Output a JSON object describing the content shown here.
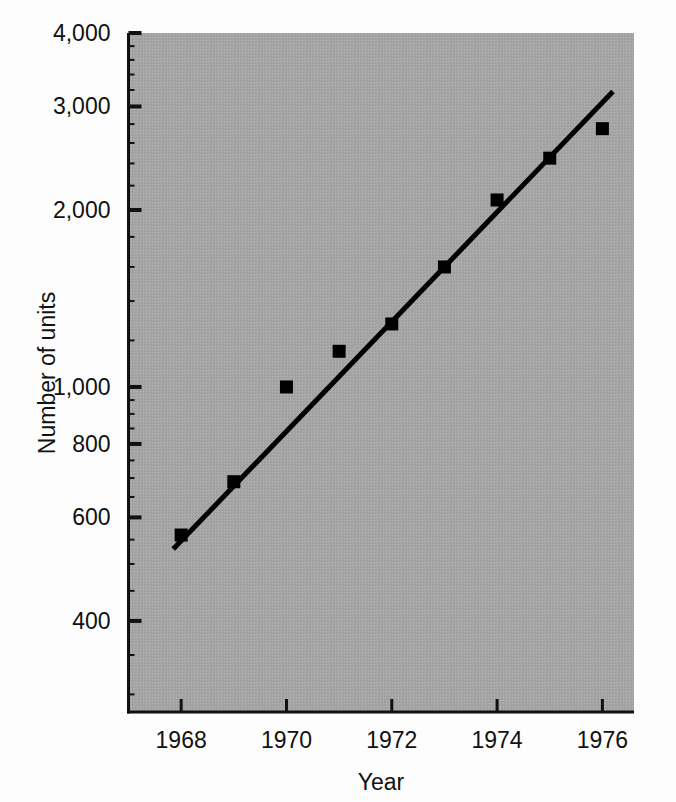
{
  "figure": {
    "background_color": "#fdfdfd",
    "plot_fill_color": "#a8a8a8",
    "axis_color": "#111111",
    "marker_color": "#000000",
    "line_color": "#000000"
  },
  "axes": {
    "x_title": "Year",
    "y_title": "Number of units"
  },
  "ticks": {
    "y_major": [
      {
        "value": 400,
        "label": "400"
      },
      {
        "value": 600,
        "label": "600"
      },
      {
        "value": 800,
        "label": "800"
      },
      {
        "value": 1000,
        "label": "1,000"
      },
      {
        "value": 2000,
        "label": "2,000"
      },
      {
        "value": 3000,
        "label": "3,000"
      },
      {
        "value": 4000,
        "label": "4,000"
      }
    ],
    "y_minor": [
      300,
      350,
      450,
      500,
      550,
      650,
      700,
      750,
      850,
      900,
      950,
      1200,
      1400,
      1600,
      1800,
      2200,
      2400,
      2600,
      2800,
      3200,
      3400,
      3600,
      3800
    ],
    "x_major": [
      {
        "value": 1968,
        "label": "1968"
      },
      {
        "value": 1970,
        "label": "1970"
      },
      {
        "value": 1972,
        "label": "1972"
      },
      {
        "value": 1974,
        "label": "1974"
      },
      {
        "value": 1976,
        "label": "1976"
      }
    ]
  },
  "chart_data": {
    "type": "scatter",
    "title": "",
    "xlabel": "Year",
    "ylabel": "Number of units",
    "xlim": [
      1967.0,
      1976.6
    ],
    "ylim": [
      280,
      4000
    ],
    "yscale": "log",
    "xscale": "linear",
    "grid": false,
    "legend": null,
    "x": [
      1968,
      1969,
      1970,
      1971,
      1972,
      1973,
      1974,
      1975,
      1976
    ],
    "values": [
      560,
      690,
      1000,
      1150,
      1280,
      1600,
      2080,
      2450,
      2750
    ],
    "series": [
      {
        "name": "Number of units",
        "marker": "square",
        "x": [
          1968,
          1969,
          1970,
          1971,
          1972,
          1973,
          1974,
          1975,
          1976
        ],
        "values": [
          560,
          690,
          1000,
          1150,
          1280,
          1600,
          2080,
          2450,
          2750
        ]
      },
      {
        "name": "fitted-trend-line",
        "type": "line",
        "x": [
          1967.85,
          1976.2
        ],
        "values": [
          530,
          3180
        ]
      }
    ],
    "y_tick_labels": [
      "400",
      "600",
      "800",
      "1,000",
      "2,000",
      "3,000",
      "4,000"
    ],
    "x_tick_labels": [
      "1968",
      "1970",
      "1972",
      "1974",
      "1976"
    ],
    "annotations": []
  }
}
